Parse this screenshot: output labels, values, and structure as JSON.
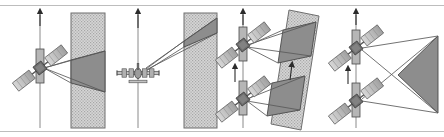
{
  "figure": {
    "width": 444,
    "height": 137,
    "background": "#ffffff",
    "border_top_y": 5,
    "border_bottom_y": 131,
    "border_color": "#b9b9b9"
  },
  "colors": {
    "line": "#4a4a4a",
    "line_dark": "#333333",
    "hatch_fill": "#d2d2d2",
    "hatch_line": "#9a9a9a",
    "swath_dark": "#8a8a8a",
    "swath_dark_stroke": "#4a4a4a",
    "body_light": "#c9c9c9",
    "body_mid": "#a8a8a8",
    "body_dark": "#6a6a6a",
    "panel_divider": "#c8c8c8",
    "arrow": "#2b2b2b",
    "white": "#ffffff"
  },
  "panels": [
    {
      "id": "panel-1",
      "label": "single-satellite-side-looking",
      "platform": "satellite",
      "platform_count": 1,
      "strip": {
        "x": 71,
        "y": 13,
        "width": 34,
        "height": 115,
        "tilt_deg": 0,
        "fill": "hatch"
      },
      "swath_shape": "trapezoid",
      "swath_position": "middle",
      "motion_arrows": 1,
      "beam_rays": 3
    },
    {
      "id": "panel-2",
      "label": "aircraft-side-looking",
      "platform": "aircraft",
      "platform_count": 1,
      "strip": {
        "x": 184,
        "y": 13,
        "width": 33,
        "height": 115,
        "tilt_deg": 0,
        "fill": "hatch"
      },
      "swath_shape": "triangle",
      "swath_position": "top",
      "motion_arrows": 1,
      "beam_rays": 3
    },
    {
      "id": "panel-3",
      "label": "dual-satellite-tilted-strip",
      "platform": "satellite",
      "platform_count": 2,
      "strip": {
        "x": 279,
        "y": 10,
        "width": 40,
        "height": 120,
        "tilt_deg": 13,
        "fill": "hatch"
      },
      "swath_shape": "quadrilateral",
      "swath_count": 2,
      "motion_arrows": 3,
      "beam_rays": 6
    },
    {
      "id": "panel-4",
      "label": "dual-satellite-crossing-beams",
      "platform": "satellite",
      "platform_count": 2,
      "strip": null,
      "swath_shape": "triangle",
      "swath_position": "right",
      "motion_arrows": 3,
      "beam_rays": 4
    }
  ],
  "platforms": [
    {
      "id": "sat-1",
      "panel": "panel-1",
      "cx": 40,
      "cy": 68,
      "rotation_deg": -38,
      "type": "satellite"
    },
    {
      "id": "aircraft-1",
      "panel": "panel-2",
      "cx": 138,
      "cy": 73,
      "rotation_deg": 0,
      "type": "aircraft"
    },
    {
      "id": "sat-2",
      "panel": "panel-3",
      "cx": 243,
      "cy": 45,
      "rotation_deg": -38,
      "type": "satellite"
    },
    {
      "id": "sat-3",
      "panel": "panel-3",
      "cx": 243,
      "cy": 99,
      "rotation_deg": -38,
      "type": "satellite"
    },
    {
      "id": "sat-4",
      "panel": "panel-4",
      "cx": 356,
      "cy": 48,
      "rotation_deg": -38,
      "type": "satellite"
    },
    {
      "id": "sat-5",
      "panel": "panel-4",
      "cx": 356,
      "cy": 101,
      "rotation_deg": -38,
      "type": "satellite"
    }
  ],
  "track_lines": [
    {
      "id": "track-1",
      "panel": "panel-1",
      "x": 40,
      "y1": 13,
      "y2": 128
    },
    {
      "id": "track-2",
      "panel": "panel-2",
      "x": 138,
      "y1": 13,
      "y2": 128
    },
    {
      "id": "track-3",
      "panel": "panel-3",
      "x": 243,
      "y1": 13,
      "y2": 128
    },
    {
      "id": "track-4",
      "panel": "panel-4",
      "x": 356,
      "y1": 13,
      "y2": 128
    }
  ]
}
